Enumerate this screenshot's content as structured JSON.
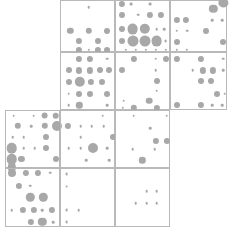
{
  "chart_data": {
    "type": "scatter",
    "title": "",
    "subtitle": "",
    "xlabel": "",
    "ylabel": "",
    "grid": false,
    "legend": null,
    "annotations": [],
    "bubble_color": "#a8a8a8",
    "panel_border_color": "#b9b9b9",
    "canvas": {
      "width": 232,
      "height": 229
    },
    "panel_grid": {
      "col_edges": [
        5,
        60,
        115,
        170,
        227
      ],
      "row_edges": [
        0,
        52,
        110,
        168,
        227
      ],
      "col_labels": [
        "C1",
        "C2",
        "C3",
        "C4"
      ],
      "row_labels": [
        "R1",
        "R2",
        "R3",
        "R4"
      ]
    },
    "panels": [
      {
        "name": "panel-r1c2",
        "row": 0,
        "col": 1,
        "x": 60,
        "y": 0,
        "w": 55,
        "h": 52,
        "points": [
          {
            "cx": 0.5,
            "cy": 0.12,
            "r": 1.3
          },
          {
            "cx": 0.17,
            "cy": 0.57,
            "r": 3.2
          },
          {
            "cx": 0.5,
            "cy": 0.57,
            "r": 3.2
          },
          {
            "cx": 0.84,
            "cy": 0.57,
            "r": 3.0
          },
          {
            "cx": 0.33,
            "cy": 0.76,
            "r": 3.1
          },
          {
            "cx": 0.67,
            "cy": 0.76,
            "r": 3.0
          },
          {
            "cx": 0.33,
            "cy": 0.94,
            "r": 3.1
          },
          {
            "cx": 0.5,
            "cy": 0.94,
            "r": 1.2
          },
          {
            "cx": 0.67,
            "cy": 0.94,
            "r": 3.1
          },
          {
            "cx": 0.84,
            "cy": 0.94,
            "r": 3.0
          }
        ]
      },
      {
        "name": "panel-r1c3",
        "row": 0,
        "col": 2,
        "x": 115,
        "y": 0,
        "w": 55,
        "h": 52,
        "points": [
          {
            "cx": 0.1,
            "cy": 0.06,
            "r": 3.1
          },
          {
            "cx": 0.28,
            "cy": 0.06,
            "r": 1.4
          },
          {
            "cx": 0.62,
            "cy": 0.06,
            "r": 1.4
          },
          {
            "cx": 0.1,
            "cy": 0.26,
            "r": 3.0
          },
          {
            "cx": 0.4,
            "cy": 0.26,
            "r": 1.3
          },
          {
            "cx": 0.62,
            "cy": 0.26,
            "r": 3.1
          },
          {
            "cx": 0.82,
            "cy": 0.26,
            "r": 3.1
          },
          {
            "cx": 0.1,
            "cy": 0.54,
            "r": 3.0
          },
          {
            "cx": 0.3,
            "cy": 0.54,
            "r": 5.4
          },
          {
            "cx": 0.52,
            "cy": 0.54,
            "r": 5.2
          },
          {
            "cx": 0.74,
            "cy": 0.54,
            "r": 1.3
          },
          {
            "cx": 0.88,
            "cy": 0.54,
            "r": 1.3
          },
          {
            "cx": 0.1,
            "cy": 0.77,
            "r": 3.0
          },
          {
            "cx": 0.3,
            "cy": 0.77,
            "r": 5.5
          },
          {
            "cx": 0.52,
            "cy": 0.77,
            "r": 5.5
          },
          {
            "cx": 0.74,
            "cy": 0.77,
            "r": 5.4
          },
          {
            "cx": 0.9,
            "cy": 0.77,
            "r": 1.4
          },
          {
            "cx": 0.18,
            "cy": 0.94,
            "r": 1.2
          },
          {
            "cx": 0.36,
            "cy": 0.94,
            "r": 1.2
          },
          {
            "cx": 0.54,
            "cy": 0.94,
            "r": 1.2
          },
          {
            "cx": 0.72,
            "cy": 0.94,
            "r": 1.2
          },
          {
            "cx": 0.9,
            "cy": 0.94,
            "r": 1.2
          }
        ]
      },
      {
        "name": "panel-r1c4",
        "row": 0,
        "col": 3,
        "x": 170,
        "y": 0,
        "w": 57,
        "h": 52,
        "points": [
          {
            "cx": 0.92,
            "cy": 0.03,
            "r": 4.6
          },
          {
            "cx": 0.74,
            "cy": 0.15,
            "r": 4.2
          },
          {
            "cx": 0.1,
            "cy": 0.37,
            "r": 3.1
          },
          {
            "cx": 0.26,
            "cy": 0.37,
            "r": 3.1
          },
          {
            "cx": 0.72,
            "cy": 0.37,
            "r": 1.3
          },
          {
            "cx": 0.9,
            "cy": 0.37,
            "r": 1.3
          },
          {
            "cx": 0.1,
            "cy": 0.57,
            "r": 1.3
          },
          {
            "cx": 0.28,
            "cy": 0.57,
            "r": 1.3
          },
          {
            "cx": 0.62,
            "cy": 0.57,
            "r": 3.0
          },
          {
            "cx": 0.1,
            "cy": 0.78,
            "r": 3.0
          },
          {
            "cx": 0.92,
            "cy": 0.78,
            "r": 3.0
          },
          {
            "cx": 0.1,
            "cy": 0.94,
            "r": 1.2
          },
          {
            "cx": 0.28,
            "cy": 0.94,
            "r": 1.2
          }
        ]
      },
      {
        "name": "panel-r2c2",
        "row": 1,
        "col": 1,
        "x": 60,
        "y": 52,
        "w": 55,
        "h": 58,
        "points": [
          {
            "cx": 0.33,
            "cy": 0.1,
            "r": 3.1
          },
          {
            "cx": 0.52,
            "cy": 0.1,
            "r": 3.1
          },
          {
            "cx": 0.84,
            "cy": 0.1,
            "r": 1.3
          },
          {
            "cx": 0.14,
            "cy": 0.3,
            "r": 3.0
          },
          {
            "cx": 0.33,
            "cy": 0.3,
            "r": 3.1
          },
          {
            "cx": 0.52,
            "cy": 0.3,
            "r": 3.1
          },
          {
            "cx": 0.7,
            "cy": 0.3,
            "r": 3.0
          },
          {
            "cx": 0.88,
            "cy": 0.3,
            "r": 3.0
          },
          {
            "cx": 0.14,
            "cy": 0.5,
            "r": 3.0
          },
          {
            "cx": 0.34,
            "cy": 0.5,
            "r": 5.2
          },
          {
            "cx": 0.55,
            "cy": 0.5,
            "r": 3.1
          },
          {
            "cx": 0.74,
            "cy": 0.5,
            "r": 3.0
          },
          {
            "cx": 0.14,
            "cy": 0.7,
            "r": 1.3
          },
          {
            "cx": 0.33,
            "cy": 0.7,
            "r": 3.0
          },
          {
            "cx": 0.52,
            "cy": 0.7,
            "r": 3.0
          },
          {
            "cx": 0.84,
            "cy": 0.7,
            "r": 3.0
          },
          {
            "cx": 0.14,
            "cy": 0.9,
            "r": 1.3
          },
          {
            "cx": 0.33,
            "cy": 0.9,
            "r": 3.2
          },
          {
            "cx": 0.84,
            "cy": 0.9,
            "r": 1.3
          }
        ]
      },
      {
        "name": "panel-r2c3",
        "row": 1,
        "col": 2,
        "x": 115,
        "y": 52,
        "w": 55,
        "h": 58,
        "points": [
          {
            "cx": 0.32,
            "cy": 0.1,
            "r": 3.1
          },
          {
            "cx": 0.72,
            "cy": 0.1,
            "r": 1.3
          },
          {
            "cx": 0.9,
            "cy": 0.1,
            "r": 3.0
          },
          {
            "cx": 0.1,
            "cy": 0.3,
            "r": 3.0
          },
          {
            "cx": 0.72,
            "cy": 0.3,
            "r": 1.3
          },
          {
            "cx": 0.74,
            "cy": 0.48,
            "r": 3.0
          },
          {
            "cx": 0.74,
            "cy": 0.65,
            "r": 1.3
          },
          {
            "cx": 0.14,
            "cy": 0.82,
            "r": 1.3
          },
          {
            "cx": 0.6,
            "cy": 0.82,
            "r": 3.3
          },
          {
            "cx": 0.12,
            "cy": 0.95,
            "r": 1.2
          },
          {
            "cx": 0.32,
            "cy": 0.95,
            "r": 3.2
          },
          {
            "cx": 0.74,
            "cy": 0.95,
            "r": 3.1
          }
        ]
      },
      {
        "name": "panel-r2c4",
        "row": 1,
        "col": 3,
        "x": 170,
        "y": 52,
        "w": 57,
        "h": 58,
        "points": [
          {
            "cx": 0.1,
            "cy": 0.1,
            "r": 3.1
          },
          {
            "cx": 0.52,
            "cy": 0.1,
            "r": 3.1
          },
          {
            "cx": 0.92,
            "cy": 0.1,
            "r": 1.3
          },
          {
            "cx": 0.38,
            "cy": 0.3,
            "r": 1.3
          },
          {
            "cx": 0.56,
            "cy": 0.3,
            "r": 3.1
          },
          {
            "cx": 0.74,
            "cy": 0.3,
            "r": 3.1
          },
          {
            "cx": 0.92,
            "cy": 0.3,
            "r": 1.3
          },
          {
            "cx": 0.52,
            "cy": 0.48,
            "r": 3.0
          },
          {
            "cx": 0.7,
            "cy": 0.48,
            "r": 3.0
          },
          {
            "cx": 0.8,
            "cy": 0.7,
            "r": 3.0
          },
          {
            "cx": 0.94,
            "cy": 0.7,
            "r": 1.3
          },
          {
            "cx": 0.1,
            "cy": 0.9,
            "r": 3.0
          },
          {
            "cx": 0.52,
            "cy": 0.9,
            "r": 3.1
          },
          {
            "cx": 0.72,
            "cy": 0.9,
            "r": 1.3
          },
          {
            "cx": 0.9,
            "cy": 0.9,
            "r": 1.3
          }
        ]
      },
      {
        "name": "panel-r3c1",
        "row": 2,
        "col": 0,
        "x": 5,
        "y": 110,
        "w": 55,
        "h": 58,
        "points": [
          {
            "cx": 0.14,
            "cy": 0.08,
            "r": 1.3
          },
          {
            "cx": 0.5,
            "cy": 0.08,
            "r": 1.3
          },
          {
            "cx": 0.7,
            "cy": 0.08,
            "r": 3.4
          },
          {
            "cx": 0.9,
            "cy": 0.08,
            "r": 3.3
          },
          {
            "cx": 0.22,
            "cy": 0.26,
            "r": 3.2
          },
          {
            "cx": 0.46,
            "cy": 0.26,
            "r": 1.3
          },
          {
            "cx": 0.7,
            "cy": 0.26,
            "r": 3.2
          },
          {
            "cx": 0.92,
            "cy": 0.26,
            "r": 5.0
          },
          {
            "cx": 0.12,
            "cy": 0.45,
            "r": 1.3
          },
          {
            "cx": 0.32,
            "cy": 0.45,
            "r": 1.3
          },
          {
            "cx": 0.72,
            "cy": 0.45,
            "r": 3.0
          },
          {
            "cx": 0.1,
            "cy": 0.64,
            "r": 5.3
          },
          {
            "cx": 0.32,
            "cy": 0.64,
            "r": 1.3
          },
          {
            "cx": 0.52,
            "cy": 0.64,
            "r": 1.3
          },
          {
            "cx": 0.72,
            "cy": 0.64,
            "r": 3.0
          },
          {
            "cx": 0.1,
            "cy": 0.83,
            "r": 5.3
          },
          {
            "cx": 0.28,
            "cy": 0.83,
            "r": 3.1
          },
          {
            "cx": 0.9,
            "cy": 0.83,
            "r": 3.0
          },
          {
            "cx": 0.1,
            "cy": 0.97,
            "r": 4.2
          }
        ]
      },
      {
        "name": "panel-r3c2",
        "row": 2,
        "col": 1,
        "x": 60,
        "y": 110,
        "w": 55,
        "h": 58,
        "points": [
          {
            "cx": 0.76,
            "cy": 0.08,
            "r": 1.3
          },
          {
            "cx": 0.12,
            "cy": 0.26,
            "r": 3.1
          },
          {
            "cx": 0.36,
            "cy": 0.26,
            "r": 1.3
          },
          {
            "cx": 0.56,
            "cy": 0.26,
            "r": 1.3
          },
          {
            "cx": 0.78,
            "cy": 0.26,
            "r": 1.3
          },
          {
            "cx": 0.36,
            "cy": 0.45,
            "r": 1.3
          },
          {
            "cx": 0.94,
            "cy": 0.45,
            "r": 3.0
          },
          {
            "cx": 0.14,
            "cy": 0.64,
            "r": 1.3
          },
          {
            "cx": 0.36,
            "cy": 0.64,
            "r": 1.3
          },
          {
            "cx": 0.58,
            "cy": 0.64,
            "r": 5.0
          },
          {
            "cx": 0.84,
            "cy": 0.64,
            "r": 1.3
          },
          {
            "cx": 0.46,
            "cy": 0.85,
            "r": 1.3
          },
          {
            "cx": 0.88,
            "cy": 0.85,
            "r": 1.3
          }
        ]
      },
      {
        "name": "panel-r3c3",
        "row": 2,
        "col": 2,
        "x": 115,
        "y": 110,
        "w": 55,
        "h": 58,
        "points": [
          {
            "cx": 0.32,
            "cy": 0.08,
            "r": 1.3
          },
          {
            "cx": 0.92,
            "cy": 0.08,
            "r": 1.3
          },
          {
            "cx": 0.62,
            "cy": 0.3,
            "r": 1.3
          },
          {
            "cx": 0.72,
            "cy": 0.52,
            "r": 3.1
          },
          {
            "cx": 0.92,
            "cy": 0.52,
            "r": 3.1
          },
          {
            "cx": 0.3,
            "cy": 0.66,
            "r": 1.3
          },
          {
            "cx": 0.7,
            "cy": 0.66,
            "r": 1.3
          },
          {
            "cx": 0.48,
            "cy": 0.85,
            "r": 3.2
          }
        ]
      },
      {
        "name": "panel-r4c1",
        "row": 3,
        "col": 0,
        "x": 5,
        "y": 168,
        "w": 55,
        "h": 59,
        "points": [
          {
            "cx": 0.1,
            "cy": 0.06,
            "r": 4.0
          },
          {
            "cx": 0.36,
            "cy": 0.06,
            "r": 3.1
          },
          {
            "cx": 0.58,
            "cy": 0.06,
            "r": 3.1
          },
          {
            "cx": 0.8,
            "cy": 0.06,
            "r": 1.3
          },
          {
            "cx": 0.24,
            "cy": 0.28,
            "r": 3.1
          },
          {
            "cx": 0.44,
            "cy": 0.28,
            "r": 1.3
          },
          {
            "cx": 0.44,
            "cy": 0.48,
            "r": 4.2
          },
          {
            "cx": 0.68,
            "cy": 0.48,
            "r": 4.2
          },
          {
            "cx": 0.1,
            "cy": 0.7,
            "r": 1.3
          },
          {
            "cx": 0.3,
            "cy": 0.7,
            "r": 3.1
          },
          {
            "cx": 0.5,
            "cy": 0.7,
            "r": 3.1
          },
          {
            "cx": 0.66,
            "cy": 0.7,
            "r": 1.3
          },
          {
            "cx": 0.84,
            "cy": 0.7,
            "r": 3.1
          },
          {
            "cx": 0.46,
            "cy": 0.9,
            "r": 3.1
          },
          {
            "cx": 0.66,
            "cy": 0.9,
            "r": 4.2
          },
          {
            "cx": 0.86,
            "cy": 0.9,
            "r": 1.3
          }
        ]
      },
      {
        "name": "panel-r4c2",
        "row": 3,
        "col": 1,
        "x": 60,
        "y": 168,
        "w": 55,
        "h": 59,
        "points": [
          {
            "cx": 0.1,
            "cy": 0.08,
            "r": 1.4
          },
          {
            "cx": 0.1,
            "cy": 0.3,
            "r": 1.4
          },
          {
            "cx": 0.1,
            "cy": 0.7,
            "r": 1.4
          },
          {
            "cx": 0.32,
            "cy": 0.7,
            "r": 1.3
          },
          {
            "cx": 0.1,
            "cy": 0.9,
            "r": 1.4
          }
        ]
      },
      {
        "name": "panel-r4c3",
        "row": 3,
        "col": 2,
        "x": 115,
        "y": 168,
        "w": 55,
        "h": 59,
        "points": [
          {
            "cx": 0.56,
            "cy": 0.38,
            "r": 1.3
          },
          {
            "cx": 0.74,
            "cy": 0.38,
            "r": 1.3
          },
          {
            "cx": 0.36,
            "cy": 0.58,
            "r": 1.3
          },
          {
            "cx": 0.56,
            "cy": 0.58,
            "r": 1.3
          },
          {
            "cx": 0.74,
            "cy": 0.58,
            "r": 1.3
          }
        ]
      }
    ]
  }
}
